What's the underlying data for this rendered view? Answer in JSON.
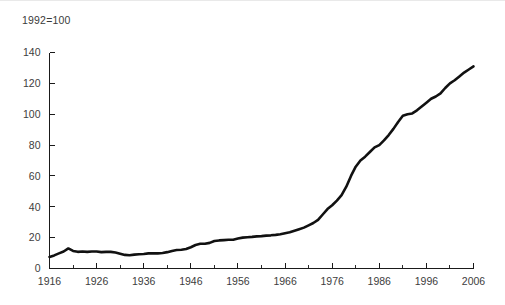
{
  "chart_data": {
    "type": "line",
    "title": "1992=100",
    "xlabel": "",
    "ylabel": "",
    "xlim": [
      1916,
      2006
    ],
    "ylim": [
      0,
      140
    ],
    "grid": false,
    "legend": null,
    "axis": {
      "y_ticks": [
        0,
        20,
        40,
        60,
        80,
        100,
        120,
        140
      ],
      "y_tick_labels": [
        "0",
        "20",
        "40",
        "60",
        "80",
        "100",
        "120",
        "140"
      ],
      "x_ticks": [
        1916,
        1926,
        1936,
        1946,
        1956,
        1966,
        1976,
        1986,
        1996,
        2006
      ],
      "x_tick_labels": [
        "1916",
        "1926",
        "1936",
        "1946",
        "1956",
        "1966",
        "1976",
        "1986",
        "1996",
        "2006"
      ],
      "x_minor_tick_interval": 5
    },
    "series": [
      {
        "name": "Index (1992=100)",
        "color": "#111111",
        "x": [
          1916,
          1917,
          1918,
          1919,
          1920,
          1921,
          1922,
          1923,
          1924,
          1925,
          1926,
          1927,
          1928,
          1929,
          1930,
          1931,
          1932,
          1933,
          1934,
          1935,
          1936,
          1937,
          1938,
          1939,
          1940,
          1941,
          1942,
          1943,
          1944,
          1945,
          1946,
          1947,
          1948,
          1949,
          1950,
          1951,
          1952,
          1953,
          1954,
          1955,
          1956,
          1957,
          1958,
          1959,
          1960,
          1961,
          1962,
          1963,
          1964,
          1965,
          1966,
          1967,
          1968,
          1969,
          1970,
          1971,
          1972,
          1973,
          1974,
          1975,
          1976,
          1977,
          1978,
          1979,
          1980,
          1981,
          1982,
          1983,
          1984,
          1985,
          1986,
          1987,
          1988,
          1989,
          1990,
          1991,
          1992,
          1993,
          1994,
          1995,
          1996,
          1997,
          1998,
          1999,
          2000,
          2001,
          2002,
          2003,
          2004,
          2005,
          2006
        ],
        "values": [
          7.5,
          8.5,
          9.8,
          11.0,
          13.0,
          11.4,
          10.8,
          11.0,
          10.8,
          11.0,
          11.0,
          10.6,
          10.8,
          10.8,
          10.4,
          9.6,
          8.8,
          8.6,
          9.0,
          9.2,
          9.4,
          9.8,
          9.8,
          9.8,
          10.0,
          10.6,
          11.4,
          12.0,
          12.2,
          12.6,
          13.8,
          15.2,
          16.0,
          16.0,
          16.6,
          17.8,
          18.2,
          18.4,
          18.6,
          18.6,
          19.4,
          20.0,
          20.3,
          20.5,
          20.8,
          21.0,
          21.3,
          21.5,
          21.8,
          22.2,
          22.9,
          23.5,
          24.5,
          25.5,
          26.5,
          28.0,
          29.5,
          31.5,
          35.0,
          38.5,
          41.0,
          44.0,
          47.5,
          53.0,
          60.0,
          66.0,
          70.0,
          72.5,
          75.5,
          78.5,
          80.0,
          83.0,
          86.5,
          90.5,
          95.0,
          99.0,
          100.0,
          100.5,
          102.5,
          105.0,
          107.5,
          110.0,
          111.5,
          113.5,
          117.0,
          120.0,
          122.0,
          124.5,
          127.0,
          129.0,
          131.0
        ]
      }
    ]
  },
  "figure": {
    "background_color": "#ffffff",
    "text_color": "#3d3d3d",
    "axis_color": "#1a1a1a"
  }
}
